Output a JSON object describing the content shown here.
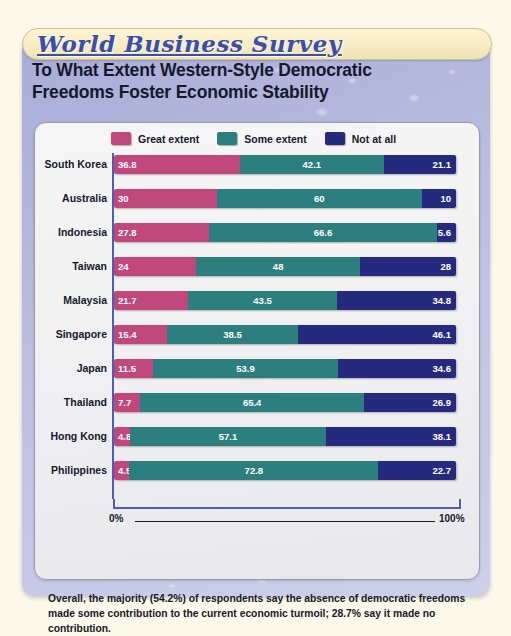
{
  "banner": {
    "title": "World Business Survey"
  },
  "headline": "To What Extent Western-Style Democratic Freedoms Foster Economic Stability",
  "axis": {
    "left_label": "0%",
    "right_label": "100%"
  },
  "footnote": "Overall, the majority (54.2%) of respondents say the absence of democratic freedoms made some contribution to the current economic turmoil; 28.7% say it made no contribution.",
  "colors": {
    "great_extent": "#c0487c",
    "some_extent": "#2d7f7f",
    "not_at_all": "#262a7e",
    "panel": "#b5b9de",
    "banner": "#f7ecc4",
    "banner_text": "#3b4fa8",
    "axis_blue": "#4a5fb5"
  },
  "chart_data": {
    "type": "bar",
    "orientation": "horizontal",
    "stacked": true,
    "title": "To What Extent Western-Style Democratic Freedoms Foster Economic Stability",
    "xlabel": "",
    "ylabel": "",
    "xlim": [
      0,
      100
    ],
    "grid": false,
    "legend_position": "top",
    "units": "percent",
    "categories": [
      "South Korea",
      "Australia",
      "Indonesia",
      "Taiwan",
      "Malaysia",
      "Singapore",
      "Japan",
      "Thailand",
      "Hong Kong",
      "Philippines"
    ],
    "series": [
      {
        "name": "Great extent",
        "color": "#c0487c",
        "values": [
          36.8,
          30,
          27.8,
          24,
          21.7,
          15.4,
          11.5,
          7.7,
          4.8,
          4.5
        ]
      },
      {
        "name": "Some extent",
        "color": "#2d7f7f",
        "values": [
          42.1,
          60,
          66.6,
          48,
          43.5,
          38.5,
          53.9,
          65.4,
          57.1,
          72.8
        ]
      },
      {
        "name": "Not at all",
        "color": "#262a7e",
        "values": [
          21.1,
          10,
          5.6,
          28,
          34.8,
          46.1,
          34.6,
          26.9,
          38.1,
          22.7
        ]
      }
    ],
    "value_labels": {
      "South Korea": [
        "36.8",
        "42.1",
        "21.1"
      ],
      "Australia": [
        "30",
        "60",
        "10"
      ],
      "Indonesia": [
        "27.8",
        "66.6",
        "5.6"
      ],
      "Taiwan": [
        "24",
        "48",
        "28"
      ],
      "Malaysia": [
        "21.7",
        "43.5",
        "34.8"
      ],
      "Singapore": [
        "15.4",
        "38.5",
        "46.1"
      ],
      "Japan": [
        "11.5",
        "53.9",
        "34.6"
      ],
      "Thailand": [
        "7.7",
        "65.4",
        "26.9"
      ],
      "Hong Kong": [
        "4.8",
        "57.1",
        "38.1"
      ],
      "Philippines": [
        "4.5",
        "72.8",
        "22.7"
      ]
    },
    "annotations": [
      "Overall, the majority (54.2%) of respondents say the absence of democratic freedoms made some contribution to the current economic turmoil; 28.7% say it made no contribution."
    ]
  }
}
